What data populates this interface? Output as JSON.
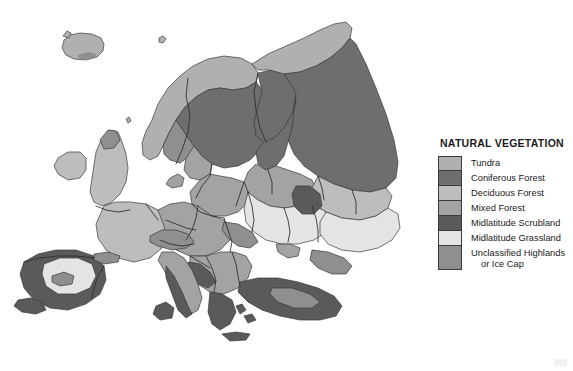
{
  "figure": {
    "kind": "thematic-map",
    "region": "Europe",
    "background_color": "#ffffff"
  },
  "legend": {
    "title": "NATURAL VEGETATION",
    "items": [
      {
        "label": "Tundra",
        "color": "#b0b0b0",
        "lines": 1
      },
      {
        "label": "Coniferous Forest",
        "color": "#6e6e6e",
        "lines": 1
      },
      {
        "label": "Deciduous Forest",
        "color": "#bdbdbd",
        "lines": 1
      },
      {
        "label": "Mixed Forest",
        "color": "#a3a3a3",
        "lines": 1
      },
      {
        "label": "Midlatitude Scrubland",
        "color": "#5a5a5a",
        "lines": 1
      },
      {
        "label": "Midlatitude Grassland",
        "color": "#e4e4e4",
        "lines": 1
      },
      {
        "label": "Unclassified Highlands",
        "label_cont": "or Ice Cap",
        "color": "#8f8f8f",
        "lines": 2
      }
    ]
  },
  "map": {
    "ocean_color": "#ffffff",
    "border_color": "#2b2b2b",
    "coast_color": "#3a3a3a",
    "regions": [
      {
        "name": "iceland",
        "vegetation": "Tundra"
      },
      {
        "name": "iceland-ice-cap",
        "vegetation": "Unclassified Highlands or Ice Cap"
      },
      {
        "name": "svalbard",
        "vegetation": "Tundra"
      },
      {
        "name": "scandinavia-coast",
        "vegetation": "Tundra"
      },
      {
        "name": "scandinavia-interior",
        "vegetation": "Coniferous Forest"
      },
      {
        "name": "norway-highlands",
        "vegetation": "Unclassified Highlands or Ice Cap"
      },
      {
        "name": "finland",
        "vegetation": "Coniferous Forest"
      },
      {
        "name": "arctic-russia-coast",
        "vegetation": "Tundra"
      },
      {
        "name": "russia-taiga",
        "vegetation": "Coniferous Forest"
      },
      {
        "name": "baltic-states",
        "vegetation": "Mixed Forest"
      },
      {
        "name": "poland-belarus",
        "vegetation": "Mixed Forest"
      },
      {
        "name": "british-isles",
        "vegetation": "Deciduous Forest"
      },
      {
        "name": "scotland-highlands",
        "vegetation": "Unclassified Highlands or Ice Cap"
      },
      {
        "name": "france",
        "vegetation": "Deciduous Forest"
      },
      {
        "name": "central-europe",
        "vegetation": "Mixed Forest"
      },
      {
        "name": "alps",
        "vegetation": "Unclassified Highlands or Ice Cap"
      },
      {
        "name": "carpathians",
        "vegetation": "Unclassified Highlands or Ice Cap"
      },
      {
        "name": "balkans",
        "vegetation": "Mixed Forest"
      },
      {
        "name": "iberia-interior",
        "vegetation": "Midlatitude Grassland"
      },
      {
        "name": "iberia-scrub",
        "vegetation": "Midlatitude Scrubland"
      },
      {
        "name": "pyrenees",
        "vegetation": "Unclassified Highlands or Ice Cap"
      },
      {
        "name": "italy-coast",
        "vegetation": "Midlatitude Scrubland"
      },
      {
        "name": "greece",
        "vegetation": "Midlatitude Scrubland"
      },
      {
        "name": "turkey",
        "vegetation": "Midlatitude Scrubland"
      },
      {
        "name": "ukraine-steppe",
        "vegetation": "Midlatitude Grassland"
      },
      {
        "name": "caspian-steppe",
        "vegetation": "Midlatitude Grassland"
      },
      {
        "name": "volga-region",
        "vegetation": "Deciduous Forest"
      },
      {
        "name": "caucasus",
        "vegetation": "Unclassified Highlands or Ice Cap"
      },
      {
        "name": "ural-foothills",
        "vegetation": "Midlatitude Scrubland"
      }
    ]
  }
}
